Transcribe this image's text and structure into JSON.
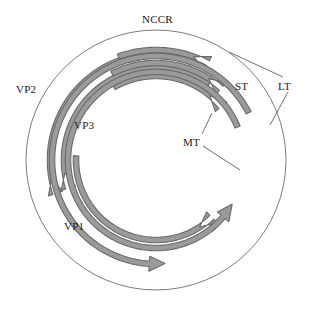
{
  "figure": {
    "kind": "polyomavirus-genome-map",
    "background_color": "#ffffff",
    "circle": {
      "name": "genome-circle",
      "cx": 156,
      "cy": 160,
      "r": 130,
      "stroke_color": "#6b6b6b",
      "stroke_width": 0.9,
      "fill": "none"
    },
    "arrow_style": {
      "fill_color": "#9a9a9a",
      "stroke_color": "#6a6a6a",
      "stroke_width": 1.1,
      "body_width": 5.5,
      "head_width": 15
    },
    "leader_line_color": "#4a4a4a",
    "leader_line_width": 0.8
  },
  "labels": [
    {
      "id": "nccr",
      "text": "NCCR",
      "x": 142,
      "y": 14
    },
    {
      "id": "vp2",
      "text": "VP2",
      "x": 16,
      "y": 84
    },
    {
      "id": "vp3",
      "text": "VP3",
      "x": 74,
      "y": 120
    },
    {
      "id": "vp1",
      "text": "VP1",
      "x": 64,
      "y": 221
    },
    {
      "id": "st",
      "text": "ST",
      "x": 235,
      "y": 81
    },
    {
      "id": "lt",
      "text": "LT",
      "x": 278,
      "y": 81
    },
    {
      "id": "mt",
      "text": "MT",
      "x": 183,
      "y": 137
    }
  ],
  "arrows": [
    {
      "id": "vp2-arrow",
      "gene": "VP2",
      "direction": "clockwise",
      "radius": 106,
      "start_angle_deg": 290,
      "end_angle_deg": 170,
      "description": "outer late-region arrow sweeping clockwise from upper area down to the 9 o'clock position"
    },
    {
      "id": "vp3-arrow",
      "gene": "VP3",
      "direction": "clockwise",
      "radius": 92,
      "start_angle_deg": 305,
      "end_angle_deg": 172,
      "description": "middle late-region arrow nested inside VP2"
    },
    {
      "id": "vp1-arrow",
      "gene": "VP1",
      "direction": "clockwise",
      "radius": 80,
      "start_angle_deg": 183,
      "end_angle_deg": 57,
      "description": "inner late-region arrow from 9 o'clock sweeping clockwise to about 5 o'clock"
    },
    {
      "id": "st-arrow",
      "gene": "ST",
      "direction": "counterclockwise",
      "radius": 110,
      "start_angle_deg": 250,
      "end_angle_deg": 290,
      "description": "short early-region arrow just right of the NCCR"
    },
    {
      "id": "mt-upper-arrow",
      "gene": "MT",
      "direction": "counterclockwise",
      "radius": 97,
      "start_angle_deg": 243,
      "end_angle_deg": 303,
      "description": "middle early-region arrow ending near 1:30"
    },
    {
      "id": "mt-lower-arrow",
      "gene": "MT",
      "direction": "counterclockwise",
      "radius": 84,
      "start_angle_deg": 240,
      "end_angle_deg": 310,
      "description": "inner early-region arrow ending at about 2 o'clock"
    },
    {
      "id": "lt-inner-arrow",
      "gene": "LT",
      "direction": "counterclockwise",
      "radius": 88,
      "start_angle_deg": 338,
      "end_angle_deg": 30,
      "description": "early-region arrow running down the right side, head pointing counterclockwise near 5 o'clock"
    },
    {
      "id": "lt-outer-arrow",
      "gene": "LT",
      "direction": "counterclockwise",
      "radius": 104,
      "start_angle_deg": 333,
      "end_angle_deg": 85,
      "description": "long outer early-region arrow sweeping from the right side around the bottom, head pointing left"
    }
  ],
  "leader_lines": [
    {
      "id": "lt-leader-upper",
      "from_label": "LT",
      "x1": 283,
      "y1": 77,
      "x2": 229,
      "y2": 52
    },
    {
      "id": "lt-leader-lower",
      "from_label": "LT",
      "x1": 288,
      "y1": 92,
      "x2": 270,
      "y2": 125
    },
    {
      "id": "mt-leader-upper",
      "from_label": "MT",
      "x1": 202,
      "y1": 134,
      "x2": 212,
      "y2": 113
    },
    {
      "id": "mt-leader-lower",
      "from_label": "MT",
      "x1": 203,
      "y1": 146,
      "x2": 240,
      "y2": 170
    }
  ]
}
